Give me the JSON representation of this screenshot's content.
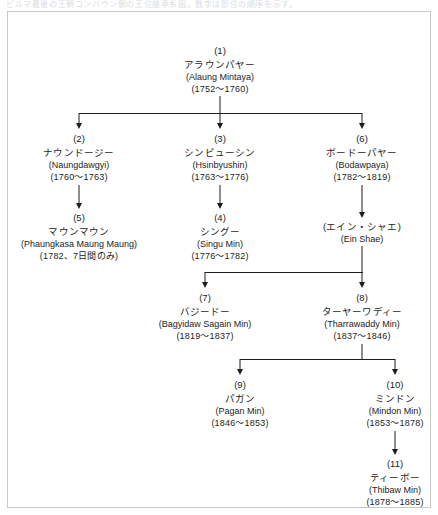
{
  "page": {
    "top_caption": "ビルマ最後の王朝コンバウン朝の王位継承系図。数字は即位の順序を示す。",
    "diagram_title": "コンバウン朝 王位継承系図"
  },
  "nodes": {
    "n1": {
      "num": "(1)",
      "jp": "アラウンパヤー",
      "rom": "(Alaung Mintaya)",
      "years": "(1752〜1760)"
    },
    "n2": {
      "num": "(2)",
      "jp": "ナウンドージー",
      "rom": "(Naungdawgyi)",
      "years": "(1760〜1763)"
    },
    "n3": {
      "num": "(3)",
      "jp": "シンビューシン",
      "rom": "(Hsinbyushin)",
      "years": "(1763〜1776)"
    },
    "n6": {
      "num": "(6)",
      "jp": "ボードーパヤー",
      "rom": "(Bodawpaya)",
      "years": "(1782〜1819)"
    },
    "n5": {
      "num": "(5)",
      "jp": "マウンマウン",
      "rom": "(Phaungkasa Maung Maung)",
      "years": "(1782、7日間のみ)"
    },
    "n4": {
      "num": "(4)",
      "jp": "シングー",
      "rom": "(Singu Min)",
      "years": "(1776〜1782)"
    },
    "nes": {
      "num": "",
      "jp": "(エイン・シャエ)",
      "rom": "(Ein Shae)",
      "years": ""
    },
    "n7": {
      "num": "(7)",
      "jp": "バジードー",
      "rom": "(Bagyidaw Sagain Min)",
      "years": "(1819〜1837)"
    },
    "n8": {
      "num": "(8)",
      "jp": "ターヤーワディー",
      "rom": "(Tharrawaddy Min)",
      "years": "(1837〜1846)"
    },
    "n9": {
      "num": "(9)",
      "jp": "パガン",
      "rom": "(Pagan Min)",
      "years": "(1846〜1853)"
    },
    "n10": {
      "num": "(10)",
      "jp": "ミンドン",
      "rom": "(Mindon Min)",
      "years": "(1853〜1878)"
    },
    "n11": {
      "num": "(11)",
      "jp": "ティーボー",
      "rom": "(Thibaw Min)",
      "years": "(1878〜1885)"
    }
  },
  "colors": {
    "line": "#1d1d1d",
    "frame": "#c9c9cc",
    "text": "#1d1d1d",
    "background": "#ffffff"
  }
}
